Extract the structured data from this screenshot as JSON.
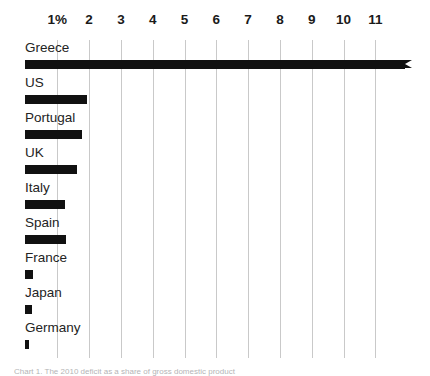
{
  "chart_data": {
    "type": "bar",
    "orientation": "horizontal",
    "title": "",
    "subtitle": "",
    "xlabel": "",
    "ylabel": "",
    "categories": [
      "Greece",
      "US",
      "Portugal",
      "UK",
      "Italy",
      "Spain",
      "France",
      "Japan",
      "Germany"
    ],
    "values": [
      12.2,
      1.95,
      1.8,
      1.65,
      1.25,
      1.3,
      0.25,
      0.22,
      0.13
    ],
    "value_unit": "%",
    "xlim": [
      0,
      11.6
    ],
    "xticks": [
      1,
      2,
      3,
      4,
      5,
      6,
      7,
      8,
      9,
      10,
      11
    ],
    "xtick_labels": [
      "1%",
      "2",
      "3",
      "4",
      "5",
      "6",
      "7",
      "8",
      "9",
      "10",
      "11"
    ],
    "grid": true,
    "grid_axis": "x",
    "legend": null,
    "bar_color": "#111111",
    "grid_color": "#c9c9c9",
    "background_color": "#ffffff",
    "axis_position": "top"
  },
  "axis": {
    "ticks": [
      {
        "value": 1,
        "label": "1%"
      },
      {
        "value": 2,
        "label": "2"
      },
      {
        "value": 3,
        "label": "3"
      },
      {
        "value": 4,
        "label": "4"
      },
      {
        "value": 5,
        "label": "5"
      },
      {
        "value": 6,
        "label": "6"
      },
      {
        "value": 7,
        "label": "7"
      },
      {
        "value": 8,
        "label": "8"
      },
      {
        "value": 9,
        "label": "9"
      },
      {
        "value": 10,
        "label": "10"
      },
      {
        "value": 11,
        "label": "11"
      }
    ]
  },
  "rows": [
    {
      "label": "Greece",
      "value": 12.2,
      "tapered": true
    },
    {
      "label": "US",
      "value": 1.95,
      "tapered": false
    },
    {
      "label": "Portugal",
      "value": 1.8,
      "tapered": false
    },
    {
      "label": "UK",
      "value": 1.65,
      "tapered": false
    },
    {
      "label": "Italy",
      "value": 1.25,
      "tapered": false
    },
    {
      "label": "Spain",
      "value": 1.3,
      "tapered": false
    },
    {
      "label": "France",
      "value": 0.25,
      "tapered": false
    },
    {
      "label": "Japan",
      "value": 0.22,
      "tapered": false
    },
    {
      "label": "Germany",
      "value": 0.13,
      "tapered": false
    }
  ],
  "caption": {
    "text": "Chart 1. The 2010 deficit as a share of gross domestic product"
  },
  "geometry": {
    "x_zero_px": 25.5,
    "px_per_unit": 31.8,
    "row_pitch_px": 35,
    "plot_top_px": 40,
    "bar_height_px": 9,
    "max_bar_right_px": 405
  }
}
